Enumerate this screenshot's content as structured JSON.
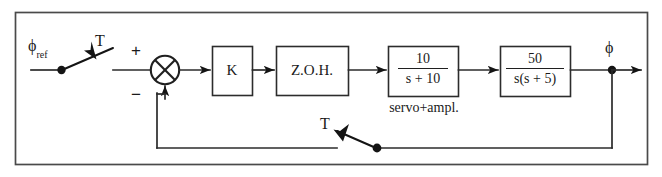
{
  "figure": {
    "type": "control-block-diagram",
    "title_visible": false,
    "line_color": "#1f1f1f",
    "background": "#ffffff"
  },
  "signals": {
    "input_label": "ϕ",
    "input_sub": "ref",
    "output_label": "ϕ"
  },
  "samplers": [
    {
      "id": "input-sampler",
      "label": "T",
      "position": "input",
      "state": "open"
    },
    {
      "id": "feedback-sampler",
      "label": "T",
      "position": "feedback",
      "state": "open"
    }
  ],
  "summing_junction": {
    "plus_label": "+",
    "minus_label": "−",
    "style": "crossed-circle"
  },
  "blocks": [
    {
      "id": "gain",
      "label": "K",
      "kind": "text"
    },
    {
      "id": "zoh",
      "label": "Z.O.H.",
      "kind": "text"
    },
    {
      "id": "servo",
      "kind": "fraction",
      "numerator": "10",
      "denominator": "s + 10",
      "caption": "servo+ampl."
    },
    {
      "id": "plant",
      "kind": "fraction",
      "numerator": "50",
      "denominator": "s(s + 5)"
    }
  ]
}
